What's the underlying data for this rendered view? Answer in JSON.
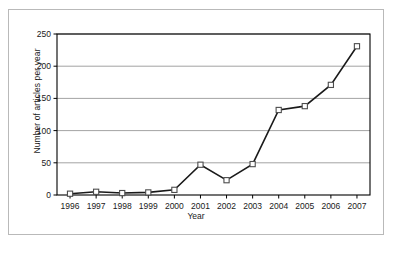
{
  "chart_data": {
    "type": "line",
    "title": "",
    "xlabel": "Year",
    "ylabel": "Number of articles per year",
    "categories": [
      "1996",
      "1997",
      "1998",
      "1999",
      "2000",
      "2001",
      "2002",
      "2003",
      "2004",
      "2005",
      "2006",
      "2007"
    ],
    "values": [
      2,
      5,
      3,
      4,
      8,
      47,
      23,
      48,
      132,
      138,
      171,
      231
    ],
    "series": [
      {
        "name": "Number of articles per year",
        "values": [
          2,
          5,
          3,
          4,
          8,
          47,
          23,
          48,
          132,
          138,
          171,
          231
        ]
      }
    ],
    "ylim": [
      0,
      250
    ],
    "yticks": [
      "0",
      "50",
      "100",
      "150",
      "200",
      "250"
    ],
    "ytick_values": [
      0,
      50,
      100,
      150,
      200,
      250
    ],
    "xticks": [
      "1996",
      "1997",
      "1998",
      "1999",
      "2000",
      "2001",
      "2002",
      "2003",
      "2004",
      "2005",
      "2006",
      "2007"
    ],
    "grid": "horizontal",
    "legend": "none",
    "marker": "open-square",
    "colors": {
      "line": "#1a1a1a",
      "marker_fill": "#ffffff",
      "marker_stroke": "#4d4d4d",
      "gridline": "#8c8c8c",
      "axis": "#000000",
      "plot_background": "#ffffff",
      "frame_border": "#b9b9b9",
      "text": "#1a1a1a"
    }
  }
}
